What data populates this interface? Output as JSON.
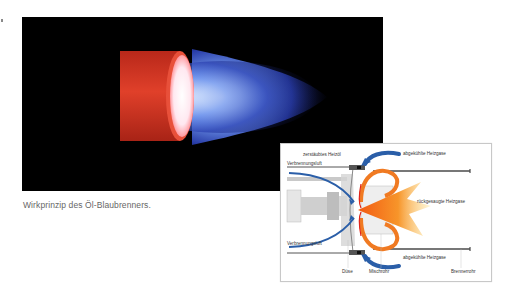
{
  "photo": {
    "subject": "blue-flame-oil-burner-photo",
    "colors": {
      "background": "#000000",
      "tube": "#d8321e",
      "core": "#ffffff",
      "flame": "#5a7ae8"
    }
  },
  "caption": {
    "text": "Wirkprinzip des Öl-Blaubrenners."
  },
  "diagram": {
    "labels": {
      "atomized_oil": "zerstäubtes Heizöl",
      "cooled_gas_top": "abgekühlte Heizgase",
      "combustion_air_top": "Verbrennungsluft",
      "recirculated_gas": "rückgesaugte Heizgase",
      "combustion_air_bottom": "Verbrennungsluft",
      "cooled_gas_bottom": "abgekühlte Heizgase",
      "nozzle": "Düse",
      "mixing_tube": "Mischrohr",
      "burner_tube": "Brennerrohr"
    },
    "colors": {
      "arrow_blue": "#2a5ea8",
      "flame_orange": "#f26a1b",
      "flame_yellow": "#fbd25a",
      "metal_gray": "#bdbdbd",
      "tube_dark": "#4a4a4a"
    }
  }
}
